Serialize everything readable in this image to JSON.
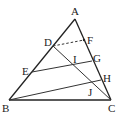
{
  "diagram": {
    "type": "geometry-triangle",
    "points": {
      "A": {
        "label": "A",
        "x": 75,
        "y": 19
      },
      "B": {
        "label": "B",
        "x": 9,
        "y": 100
      },
      "C": {
        "label": "C",
        "x": 111,
        "y": 100
      },
      "D": {
        "label": "D",
        "x": 53,
        "y": 46
      },
      "E": {
        "label": "E",
        "x": 32,
        "y": 72
      },
      "F": {
        "label": "F",
        "x": 84,
        "y": 40
      },
      "G": {
        "label": "G",
        "x": 92,
        "y": 61
      },
      "H": {
        "label": "H",
        "x": 101,
        "y": 80
      },
      "I": {
        "label": "I",
        "x": 75,
        "y": 64
      },
      "J": {
        "label": "J",
        "x": 93,
        "y": 83
      }
    },
    "segments": [
      {
        "from": "A",
        "to": "B",
        "style": "solid"
      },
      {
        "from": "A",
        "to": "C",
        "style": "solid"
      },
      {
        "from": "B",
        "to": "C",
        "style": "solid"
      },
      {
        "from": "D",
        "to": "C",
        "style": "solid"
      },
      {
        "from": "E",
        "to": "G",
        "style": "solid"
      },
      {
        "from": "B",
        "to": "H",
        "style": "solid"
      },
      {
        "from": "D",
        "to": "F",
        "style": "dashed"
      }
    ]
  }
}
